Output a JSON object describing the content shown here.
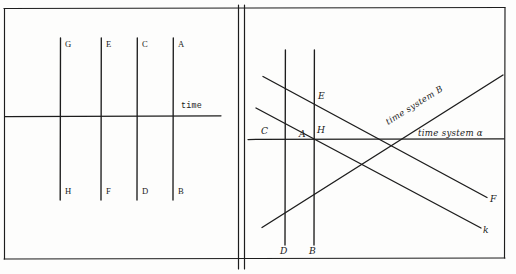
{
  "figure": {
    "ink_color": "#1d1d1d",
    "paper_color": "#fdfdfc"
  },
  "left_panel": {
    "name": "left-diagram",
    "axis_label": "time",
    "horizontal_axis": {
      "label": "time",
      "y": 116,
      "x_start": 5,
      "x_end": 221
    },
    "worldlines": [
      {
        "id": "wl-1",
        "x": 60,
        "top_label": "G",
        "bottom_label": "H"
      },
      {
        "id": "wl-2",
        "x": 101,
        "top_label": "E",
        "bottom_label": "F"
      },
      {
        "id": "wl-3",
        "x": 137,
        "top_label": "C",
        "bottom_label": "D"
      },
      {
        "id": "wl-4",
        "x": 173,
        "top_label": "A",
        "bottom_label": "B"
      }
    ],
    "top_label_y": 46,
    "bottom_label_y": 193
  },
  "right_panel": {
    "name": "right-diagram",
    "horizontal_axis": {
      "label": "time system α",
      "y": 139,
      "x_start": 248,
      "x_end": 504
    },
    "worldlines": [
      {
        "id": "wl-r1",
        "x": 285,
        "top_label": "",
        "bottom_label": "D"
      },
      {
        "id": "wl-r2",
        "x": 314,
        "top_label": "E",
        "bottom_label": "B"
      }
    ],
    "diagonals": [
      {
        "id": "diag-up",
        "label": "time system B",
        "from": [
          262,
          227
        ],
        "to": [
          503,
          75
        ]
      },
      {
        "id": "diag-down-f",
        "label": "F",
        "from": [
          263,
          77
        ],
        "to": [
          487,
          198
        ]
      },
      {
        "id": "diag-down-k",
        "label": "k",
        "from": [
          256,
          108
        ],
        "to": [
          481,
          228
        ]
      }
    ],
    "point_labels": [
      {
        "id": "pt-C",
        "text": "C",
        "x": 264,
        "y": 131
      },
      {
        "id": "pt-A",
        "text": "A",
        "x": 302,
        "y": 136
      },
      {
        "id": "pt-H",
        "text": "H",
        "x": 320,
        "y": 132
      },
      {
        "id": "pt-E",
        "text": "E",
        "x": 320,
        "y": 97
      },
      {
        "id": "pt-D",
        "text": "D",
        "x": 282,
        "y": 251
      },
      {
        "id": "pt-B",
        "text": "B",
        "x": 311,
        "y": 251
      },
      {
        "id": "pt-F",
        "text": "F",
        "x": 491,
        "y": 199
      },
      {
        "id": "pt-k",
        "text": "k",
        "x": 484,
        "y": 230
      }
    ],
    "system_labels": [
      {
        "id": "sys-beta",
        "text": "time system B",
        "x": 390,
        "y": 120,
        "rotation": -32
      },
      {
        "id": "sys-alpha",
        "text": "time system α",
        "x": 420,
        "y": 135,
        "rotation": 0
      }
    ]
  }
}
